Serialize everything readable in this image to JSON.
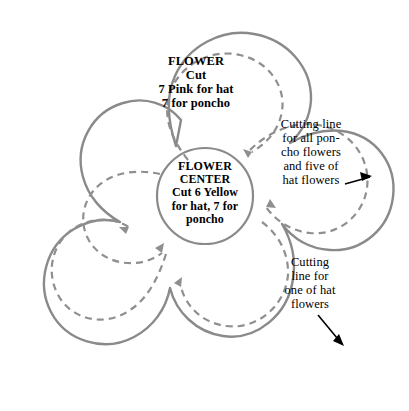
{
  "diagram": {
    "colors": {
      "solid_line": "#8a8a8a",
      "dashed_line": "#8f8f8f",
      "arrow": "#000000",
      "text": "#000000",
      "background": "#ffffff"
    },
    "petal_top": {
      "label": "FLOWER\nCut\n7 Pink for hat\n7 for poncho"
    },
    "center": {
      "label": "FLOWER\nCENTER\nCut 6 Yellow\nfor hat, 7 for\nponcho"
    },
    "annotations": [
      {
        "id": "upper-right",
        "text": "Cutting line\nfor all pon-\ncho flowers\nand five of\nhat flowers"
      },
      {
        "id": "lower-right",
        "text": "Cutting\nline for\none of hat\nflowers"
      }
    ],
    "legend": {
      "solid_name": "outer-outline",
      "dashed_name": "cutting-line"
    }
  }
}
